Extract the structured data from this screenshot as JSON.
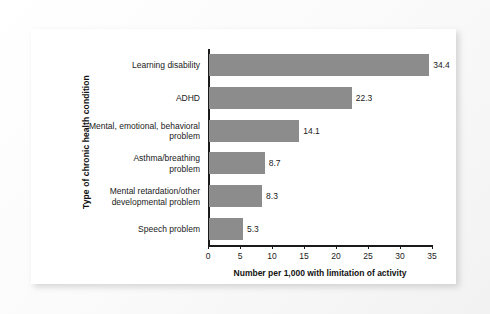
{
  "figure": {
    "background_color": "#fafafa",
    "panel_color": "#ffffff",
    "bar_color": "#8c8c8c",
    "axis_color": "#1a1a1a"
  },
  "chart_data": {
    "type": "bar",
    "orientation": "horizontal",
    "title": "",
    "xlabel": "Number per 1,000 with limitation of activity",
    "ylabel": "Type of chronic health condition",
    "categories": [
      "Learning disability",
      "ADHD",
      "Mental, emotional, behavioral\nproblem",
      "Asthma/breathing\nproblem",
      "Mental retardation/other\ndevelopmental problem",
      "Speech problem"
    ],
    "values": [
      34.4,
      22.3,
      14.1,
      8.7,
      8.3,
      5.3
    ],
    "value_labels": [
      "34.4",
      "22.3",
      "14.1",
      "8.7",
      "8.3",
      "5.3"
    ],
    "xlim": [
      0,
      35
    ],
    "xticks": [
      0,
      5,
      10,
      15,
      20,
      25,
      30,
      35
    ],
    "xtick_labels": [
      "0",
      "5",
      "10",
      "15",
      "20",
      "25",
      "30",
      "35"
    ],
    "grid": false,
    "legend": null
  }
}
